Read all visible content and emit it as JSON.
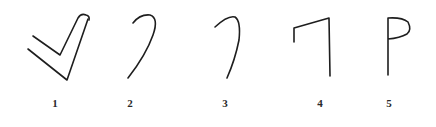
{
  "figure": {
    "stroke_color": "#1e1e1e",
    "background_color": "#ffffff",
    "items": [
      {
        "label": "1",
        "shape": "check-mark",
        "label_x": 55
      },
      {
        "label": "2",
        "shape": "hook-stroke",
        "label_x": 130
      },
      {
        "label": "3",
        "shape": "hook-stroke",
        "label_x": 225
      },
      {
        "label": "4",
        "shape": "seven-like-stroke",
        "label_x": 320
      },
      {
        "label": "5",
        "shape": "p-like-stroke",
        "label_x": 389
      }
    ]
  }
}
